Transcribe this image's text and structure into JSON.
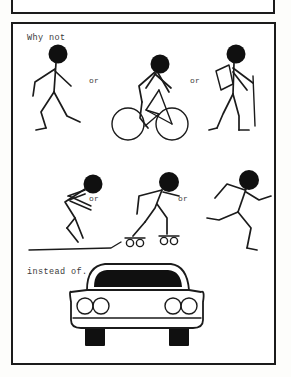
{
  "panels": {
    "top_panel": {
      "name": "empty-panel",
      "content": ""
    },
    "main_panel": {
      "caption_top": "Why not",
      "caption_bottom": "instead of...",
      "connector_label": "or",
      "rows": [
        {
          "row": 1,
          "figures": [
            {
              "id": "walker",
              "label": "walking-stick-figure"
            },
            {
              "id": "cyclist",
              "label": "cyclist-stick-figure"
            },
            {
              "id": "hiker",
              "label": "hiker-with-backpack-stick-figure"
            }
          ],
          "separators": [
            "or",
            "or"
          ]
        },
        {
          "row": 2,
          "figures": [
            {
              "id": "skier",
              "label": "skier-stick-figure"
            },
            {
              "id": "skater",
              "label": "rollerblader-stick-figure"
            },
            {
              "id": "runner",
              "label": "running-stick-figure"
            }
          ],
          "separators": [
            "or",
            "or"
          ]
        },
        {
          "row": 3,
          "figures": [
            {
              "id": "car",
              "label": "car-front-view"
            }
          ],
          "separators": []
        }
      ]
    }
  },
  "colors": {
    "ink": "#1b1b1b",
    "fill_black": "#101010",
    "paper": "#ffffff",
    "caption_text": "#3a3a3a"
  }
}
